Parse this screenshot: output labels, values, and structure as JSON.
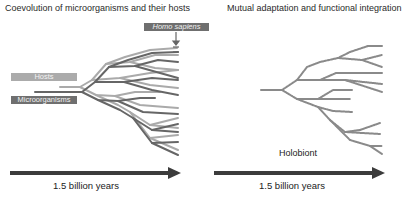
{
  "left_panel": {
    "title": "Coevolution of microorganisms and their hosts",
    "labels": {
      "hosts": "Hosts",
      "microorganisms": "Microorganisms",
      "homo_sapiens": "Homo sapiens"
    },
    "timeline": "1.5 billion years"
  },
  "right_panel": {
    "title": "Mutual adaptation and functional integration",
    "label": "Holobiont",
    "timeline": "1.5 billion years"
  },
  "colors": {
    "host_line": "#aaaaaa",
    "microbe_line": "#666666",
    "holobiont_line": "#8a8a8a",
    "arrow": "#3c3c3c",
    "hosts_tag": "#ababab",
    "microorganisms_tag": "#6f6f6f"
  }
}
